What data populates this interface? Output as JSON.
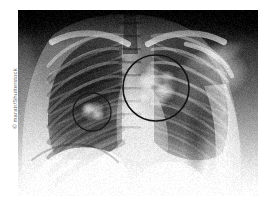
{
  "page": {
    "width": 272,
    "height": 207,
    "background_color": "#ffffff"
  },
  "credit": {
    "symbol": "©",
    "text": "© maratr/Shutterstock",
    "color": "#6d6d6d",
    "orientation": "vertical-bottom-to-top"
  },
  "figure": {
    "kind": "chest-radiograph",
    "alt": "Frontal chest X-ray (PA view) showing ribs, clavicles, spine, heart border and diaphragm, with two dark circles annotating areas of increased opacity in the upper lung zones",
    "x": 18,
    "y": 10,
    "width": 240,
    "height": 186,
    "film_background_color": "#0b0b0b",
    "lung_field_color": "#3a3a3a",
    "bone_color": "#e8e8e8",
    "soft_tissue_color": "#b8b8b8",
    "diaphragm_color": "#f2f2f2"
  },
  "annotations": [
    {
      "name": "large-lesion-circle",
      "label": "upper-zone opacity (large)",
      "cx": 138,
      "cy": 78,
      "r": 33,
      "stroke_color": "#141414",
      "stroke_width": 1.6
    },
    {
      "name": "small-lesion-circle",
      "label": "opacity (small)",
      "cx": 74,
      "cy": 102,
      "r": 19,
      "stroke_color": "#1a1a1a",
      "stroke_width": 1.3
    }
  ]
}
